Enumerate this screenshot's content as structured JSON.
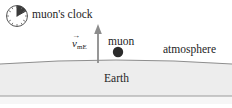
{
  "figure": {
    "background_color": "#ffffff",
    "width": 232,
    "height": 108
  },
  "labels": {
    "clock": "muon's clock",
    "muon": "muon",
    "atmosphere": "atmosphere",
    "earth": "Earth",
    "velocity_symbol": "v",
    "velocity_subscript": "mE",
    "velocity_vector_hat": "→"
  },
  "icons": {
    "clock": "clock-icon",
    "muon_particle": "muon-particle-dot",
    "velocity_arrow": "up-arrow-icon"
  },
  "colors": {
    "ink": "#242424",
    "line": "#6f6f6f",
    "earth_fill": "#ededed",
    "earth_fill_bottom": "#f4f4f4",
    "muon_dot": "#2b2b2b",
    "clock_face": "#ffffff",
    "clock_wedge": "#3b3b3b",
    "clock_rim": "#555555",
    "arrow": "#8c8c8c",
    "baseline": "#9a9a9a"
  },
  "geometry": {
    "clock_center_x": 17,
    "clock_center_y": 16,
    "clock_radius": 11,
    "clock_wedge_start_deg": 0,
    "clock_wedge_end_deg": 72,
    "muon_dot_x": 118,
    "muon_dot_y": 52,
    "muon_dot_radius": 5,
    "arrow_x": 98,
    "arrow_tip_y": 25,
    "arrow_tail_y": 63,
    "ground_left_y": 64,
    "ground_apex_y": 59,
    "ground_right_y": 64,
    "earth_band_bottom_y": 96
  }
}
